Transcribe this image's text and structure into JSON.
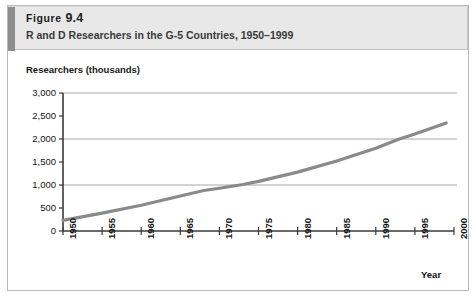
{
  "figure": {
    "label": "Figure",
    "number": "9.4",
    "title_full": "Figure 9.4",
    "subtitle": "R and D Researchers in the G-5 Countries, 1950–1999"
  },
  "colors": {
    "header_band": "#e8e8e8",
    "header_accent": "#8e8e8e",
    "frame_border": "#b9b9b9",
    "axis": "#3a3a3a",
    "gridline": "#a8a8a8",
    "series_line": "#8a8a8a",
    "text": "#141414"
  },
  "chart_data": {
    "type": "line",
    "title": "R and D Researchers in the G-5 Countries, 1950–1999",
    "xlabel": "Year",
    "ylabel": "Researchers (thousands)",
    "xlim": [
      1950,
      2000
    ],
    "ylim": [
      0,
      3000
    ],
    "grid": "horizontal-major",
    "legend": "none",
    "y_ticks": [
      0,
      500,
      1000,
      1500,
      2000,
      2500,
      3000
    ],
    "y_tick_labels": [
      "0",
      "500",
      "1,000",
      "1,500",
      "2,000",
      "2,500",
      "3,000"
    ],
    "y_major_gridlines": [
      1000,
      2000,
      3000
    ],
    "x_ticks": [
      1950,
      1955,
      1960,
      1965,
      1970,
      1975,
      1980,
      1985,
      1990,
      1995,
      2000
    ],
    "x_tick_labels": [
      "1950",
      "1955",
      "1960",
      "1965",
      "1970",
      "1975",
      "1980",
      "1985",
      "1990",
      "1995",
      "2000"
    ],
    "series": [
      {
        "name": "R and D researchers, G-5 countries",
        "x": [
          1950,
          1955,
          1960,
          1965,
          1968,
          1970,
          1973,
          1975,
          1980,
          1985,
          1990,
          1993,
          1995,
          1999
        ],
        "values": [
          230,
          390,
          560,
          760,
          880,
          930,
          1010,
          1080,
          1280,
          1520,
          1800,
          2000,
          2110,
          2350
        ]
      }
    ]
  }
}
